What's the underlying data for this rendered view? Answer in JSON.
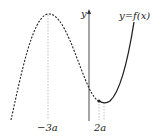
{
  "figure": {
    "curve_label": "y=f(x)",
    "y_axis_label": "y",
    "x_labels": [
      "−3a",
      "2a"
    ],
    "colors": {
      "curve": "#222222",
      "guide": "#999999",
      "axis": "#333333"
    }
  }
}
